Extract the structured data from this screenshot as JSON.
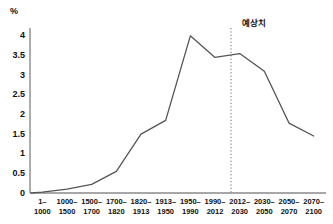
{
  "chart_data": {
    "type": "line",
    "title": "",
    "xlabel": "",
    "ylabel": "%",
    "unit_label": "%",
    "ylim": [
      0,
      4.2
    ],
    "yticks": [
      0,
      0.5,
      1,
      1.5,
      2,
      2.5,
      3,
      3.5,
      4
    ],
    "ytick_labels": [
      "0",
      "0.5",
      "1",
      "1.5",
      "2",
      "2.5",
      "3",
      "3.5",
      "4"
    ],
    "grid": false,
    "legend": null,
    "categories": [
      "1–1000",
      "1000–1500",
      "1500–1700",
      "1700–1820",
      "1820–1913",
      "1913–1950",
      "1950–1990",
      "1990–2012",
      "2012–2030",
      "2030–2050",
      "2050–2070",
      "2070–2100"
    ],
    "category_lines": [
      [
        "1–",
        "1000"
      ],
      [
        "1000–",
        "1500"
      ],
      [
        "1500–",
        "1700"
      ],
      [
        "1700–",
        "1820"
      ],
      [
        "1820–",
        "1913"
      ],
      [
        "1913–",
        "1950"
      ],
      [
        "1950–",
        "1990"
      ],
      [
        "1990–",
        "2012"
      ],
      [
        "2012–",
        "2030"
      ],
      [
        "2030–",
        "2050"
      ],
      [
        "2050–",
        "2070"
      ],
      [
        "2070–",
        "2100"
      ]
    ],
    "values": [
      0.02,
      0.1,
      0.22,
      0.55,
      1.5,
      1.85,
      4.0,
      3.45,
      3.55,
      3.1,
      1.78,
      1.45
    ],
    "annotations": [
      {
        "text": "예상치",
        "at_category": "2012–2030",
        "type": "forecast-divider",
        "line_style": "dotted"
      }
    ],
    "series_color": "#555555",
    "axis_color": "#888888"
  }
}
